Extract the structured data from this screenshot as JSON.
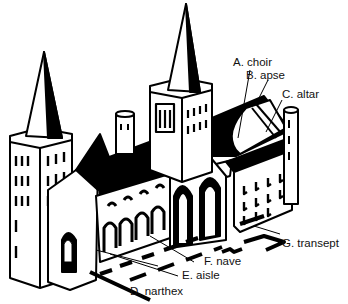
{
  "diagram": {
    "labels": [
      {
        "id": "A",
        "text": "A. choir"
      },
      {
        "id": "B",
        "text": "B. apse"
      },
      {
        "id": "C",
        "text": "C. altar"
      },
      {
        "id": "D",
        "text": "D. narthex"
      },
      {
        "id": "E",
        "text": "E. aisle"
      },
      {
        "id": "F",
        "text": "F. nave"
      },
      {
        "id": "G",
        "text": "G. transept"
      }
    ]
  }
}
